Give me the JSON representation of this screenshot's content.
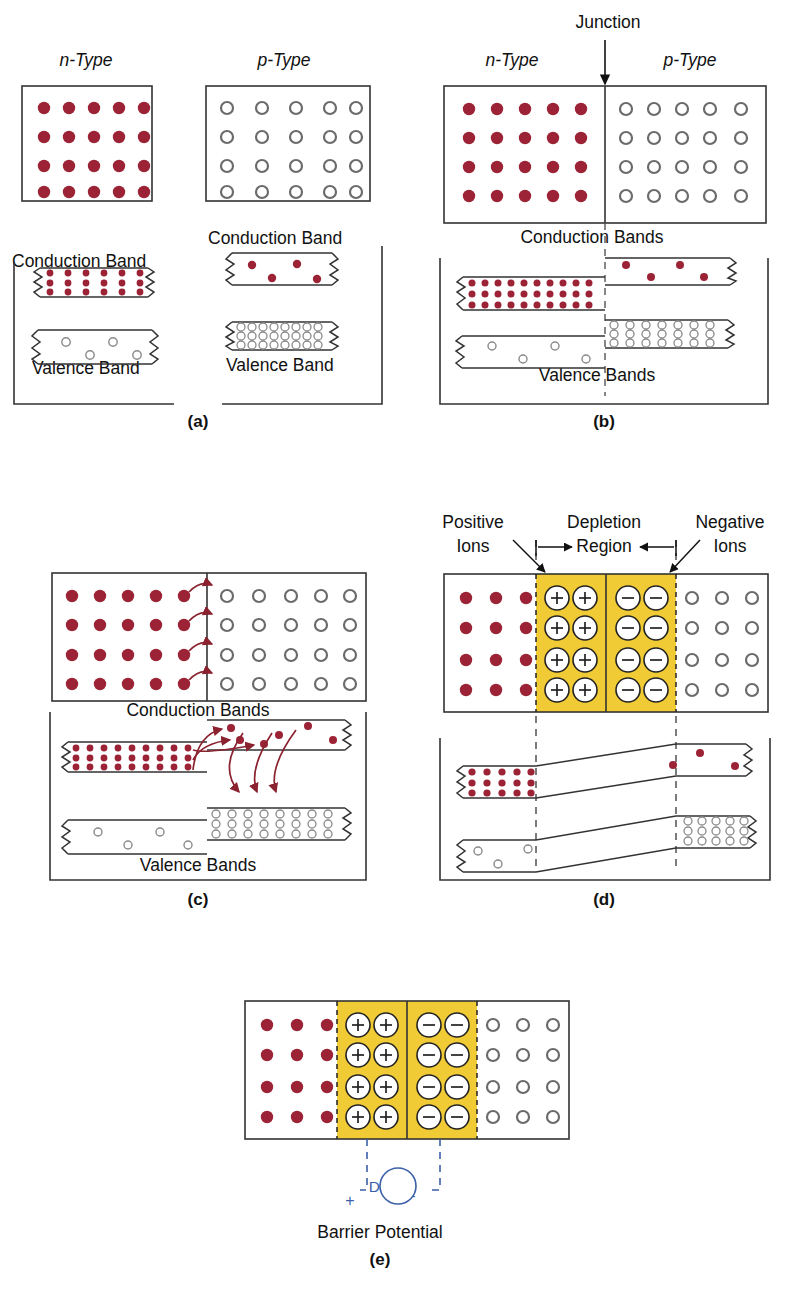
{
  "figure": {
    "domain": "semiconductor-pn-junction-diagram"
  },
  "colors": {
    "electron": "#9B2335",
    "hole_stroke": "#6b6b6b",
    "depletion_fill": "#F0CB35",
    "line": "#1a1a1a",
    "dc_blue": "#3b5fa8",
    "background": "#ffffff"
  },
  "panels": [
    {
      "id": "a",
      "tag": "(a)",
      "labels": {
        "n_type": "n-Type",
        "p_type": "p-Type",
        "conduction_band_left": "Conduction Band",
        "valence_band_left": "Valence Band",
        "conduction_band_right": "Conduction Band",
        "valence_band_right": "Valence Band"
      },
      "n_block": {
        "rows": 4,
        "cols": 5,
        "carrier": "electron"
      },
      "p_block": {
        "rows": 4,
        "cols": 5,
        "carrier": "hole"
      },
      "bands": {
        "n_conduction": {
          "fill": "many-electrons",
          "rows": 3,
          "cols": 6
        },
        "n_valence": {
          "fill": "few-holes",
          "count": 5
        },
        "p_conduction": {
          "fill": "few-electrons",
          "count": 4
        },
        "p_valence": {
          "fill": "many-holes",
          "rows": 3,
          "cols": 8
        }
      }
    },
    {
      "id": "b",
      "tag": "(b)",
      "labels": {
        "junction": "Junction",
        "n_type": "n-Type",
        "p_type": "p-Type",
        "conduction_bands": "Conduction Bands",
        "valence_bands": "Valence Bands"
      },
      "n_block": {
        "rows": 4,
        "cols": 5,
        "carrier": "electron"
      },
      "p_block": {
        "rows": 4,
        "cols": 5,
        "carrier": "hole"
      },
      "bands": {
        "n_conduction": {
          "fill": "many-electrons",
          "rows": 3,
          "cols": 11
        },
        "n_valence": {
          "fill": "few-holes",
          "count": 5
        },
        "p_conduction": {
          "fill": "few-electrons",
          "count": 4
        },
        "p_valence": {
          "fill": "many-holes",
          "rows": 3,
          "cols": 7
        }
      }
    },
    {
      "id": "c",
      "tag": "(c)",
      "labels": {
        "conduction_bands": "Conduction Bands",
        "valence_bands": "Valence Bands"
      },
      "n_block": {
        "rows": 4,
        "cols": 5,
        "carrier": "electron"
      },
      "p_block": {
        "rows": 4,
        "cols": 5,
        "carrier": "hole"
      },
      "diffusion_arrows_block": 4,
      "diffusion_arrows_band_up": 3,
      "recombination_arrows_down": 3,
      "bands": {
        "n_conduction": {
          "fill": "many-electrons",
          "rows": 3,
          "cols": 10
        },
        "n_valence": {
          "fill": "few-holes",
          "count": 4
        },
        "p_conduction": {
          "fill": "few-electrons",
          "count": 6
        },
        "p_valence": {
          "fill": "many-holes",
          "rows": 3,
          "cols": 8
        }
      }
    },
    {
      "id": "d",
      "tag": "(d)",
      "labels": {
        "positive_ions": "Positive\nIons",
        "positive_ions_line1": "Positive",
        "positive_ions_line2": "Ions",
        "depletion": "Depletion",
        "region": "Region",
        "negative_ions_line1": "Negative",
        "negative_ions_line2": "Ions"
      },
      "n_block": {
        "rows": 4,
        "cols": 3,
        "carrier": "electron"
      },
      "p_block": {
        "rows": 4,
        "cols": 3,
        "carrier": "hole"
      },
      "depletion": {
        "positive_ion_symbol": "+",
        "negative_ion_symbol": "−",
        "rows": 4,
        "pos_cols": 2,
        "neg_cols": 2
      },
      "bands": {
        "n_conduction": {
          "fill": "many-electrons",
          "rows": 3,
          "cols": 5
        },
        "n_valence": {
          "fill": "few-holes",
          "count": 3
        },
        "p_conduction": {
          "fill": "few-electrons",
          "count": 3
        },
        "p_valence": {
          "fill": "many-holes",
          "rows": 3,
          "cols": 5
        }
      }
    },
    {
      "id": "e",
      "tag": "(e)",
      "labels": {
        "dc_source": "DC",
        "plus_terminal": "+",
        "minus_terminal": "−",
        "barrier_potential": "Barrier Potential"
      },
      "n_block": {
        "rows": 4,
        "cols": 3,
        "carrier": "electron"
      },
      "p_block": {
        "rows": 4,
        "cols": 3,
        "carrier": "hole"
      },
      "depletion": {
        "positive_ion_symbol": "+",
        "negative_ion_symbol": "−",
        "rows": 4,
        "pos_cols": 2,
        "neg_cols": 2
      }
    }
  ]
}
